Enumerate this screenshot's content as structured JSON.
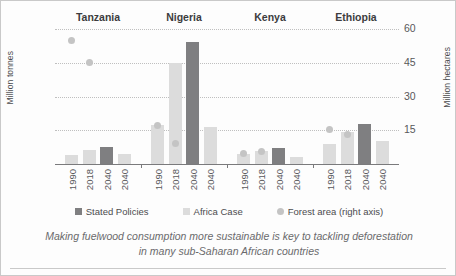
{
  "axes": {
    "left_title": "Million tonnes",
    "right_title": "Million hectares",
    "left_ticks": [
      "400",
      "300",
      "200",
      "100"
    ],
    "right_ticks": [
      "60",
      "45",
      "30",
      "15"
    ]
  },
  "legend": [
    {
      "label": "Stated Policies",
      "marker": "square-swatch",
      "color": "#7f7f81"
    },
    {
      "label": "Africa Case",
      "marker": "square-swatch",
      "color": "#dcdcdc"
    },
    {
      "label": "Forest area (right axis)",
      "marker": "circle-swatch",
      "color": "#c4c4c4"
    }
  ],
  "caption": "Making fuelwood consumption more sustainable is key to tackling deforestation in many sub-Saharan African countries",
  "chart_data": {
    "type": "bar",
    "title": "",
    "xlabel": "",
    "ylabel": "Million tonnes",
    "ylabel_right": "Million hectares",
    "ylim": [
      0,
      400
    ],
    "ylim_right": [
      0,
      60
    ],
    "grid": true,
    "legend_position": "bottom",
    "categories": [
      "1990",
      "2018",
      "2040",
      "2040"
    ],
    "groups": [
      {
        "name": "Tanzania",
        "bars": [
          {
            "x": "1990",
            "series": "Africa Case",
            "value": 28
          },
          {
            "x": "2018",
            "series": "Africa Case",
            "value": 42
          },
          {
            "x": "2040",
            "series": "Stated Policies",
            "value": 50
          },
          {
            "x": "2040",
            "series": "Africa Case",
            "value": 30
          }
        ],
        "forest_area": [
          {
            "x": "1990",
            "value": 55
          },
          {
            "x": "2018",
            "value": 45
          }
        ]
      },
      {
        "name": "Nigeria",
        "bars": [
          {
            "x": "1990",
            "series": "Africa Case",
            "value": 115
          },
          {
            "x": "2018",
            "series": "Africa Case",
            "value": 300
          },
          {
            "x": "2040",
            "series": "Stated Policies",
            "value": 363
          },
          {
            "x": "2040",
            "series": "Africa Case",
            "value": 110
          }
        ],
        "forest_area": [
          {
            "x": "1990",
            "value": 17
          },
          {
            "x": "2018",
            "value": 9
          }
        ]
      },
      {
        "name": "Kenya",
        "bars": [
          {
            "x": "1990",
            "series": "Africa Case",
            "value": 30
          },
          {
            "x": "2018",
            "series": "Africa Case",
            "value": 40
          },
          {
            "x": "2040",
            "series": "Stated Policies",
            "value": 48
          },
          {
            "x": "2040",
            "series": "Africa Case",
            "value": 22
          }
        ],
        "forest_area": [
          {
            "x": "1990",
            "value": 4.5
          },
          {
            "x": "2018",
            "value": 5.5
          }
        ]
      },
      {
        "name": "Ethiopia",
        "bars": [
          {
            "x": "1990",
            "series": "Africa Case",
            "value": 60
          },
          {
            "x": "2018",
            "series": "Africa Case",
            "value": 95
          },
          {
            "x": "2040",
            "series": "Stated Policies",
            "value": 120
          },
          {
            "x": "2040",
            "series": "Africa Case",
            "value": 68
          }
        ],
        "forest_area": [
          {
            "x": "1990",
            "value": 15.5
          },
          {
            "x": "2018",
            "value": 13
          }
        ]
      }
    ],
    "series": [
      {
        "name": "Stated Policies",
        "color": "#7f7f81",
        "type": "bar"
      },
      {
        "name": "Africa Case",
        "color": "#dcdcdc",
        "type": "bar"
      },
      {
        "name": "Forest area (right axis)",
        "color": "#c4c4c4",
        "type": "scatter",
        "axis": "right"
      }
    ]
  }
}
